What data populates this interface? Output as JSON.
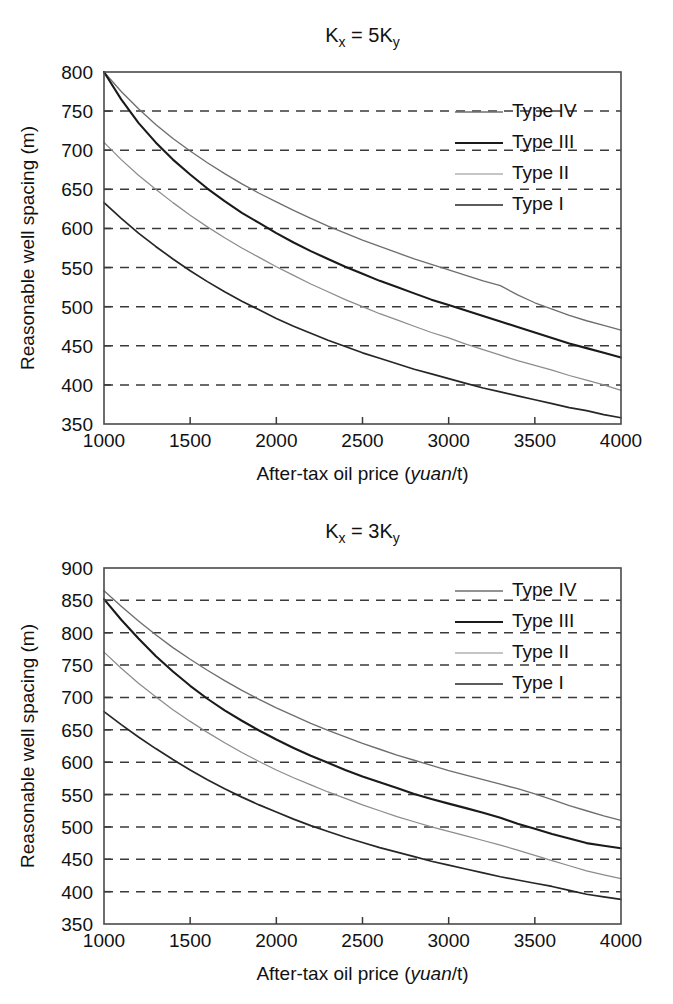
{
  "figure": {
    "background": "#ffffff",
    "series_colors": {
      "Type I": "#262626",
      "Type II": "#8c8c8c",
      "Type III": "#1a1a1a",
      "Type IV": "#6e6e6e"
    }
  },
  "panels": [
    {
      "id": "top",
      "title_main": "K",
      "title_sub1": "x",
      "title_eq": " = 5K",
      "title_sub2": "y",
      "title_plain": "Kx = 5Ky"
    },
    {
      "id": "bottom",
      "title_main": "K",
      "title_sub1": "x",
      "title_eq": " = 3K",
      "title_sub2": "y",
      "title_plain": "Kx = 3Ky"
    }
  ],
  "axis_common": {
    "xlabel_prefix": "After-tax oil price (",
    "xlabel_italic": "yuan",
    "xlabel_suffix": "/t)",
    "xlabel_plain": "After-tax oil price (yuan/t)",
    "ylabel": "Reasonable well spacing (m)",
    "xticks": [
      1000,
      1500,
      2000,
      2500,
      3000,
      3500,
      4000
    ],
    "xlim": [
      1000,
      4000
    ],
    "grid": true,
    "legend_position": "top-right"
  },
  "chart_data": [
    {
      "type": "line",
      "title": "Kx = 5Ky",
      "xlabel": "After-tax oil price (yuan/t)",
      "ylabel": "Reasonable well spacing (m)",
      "xlim": [
        1000,
        4000
      ],
      "ylim": [
        350,
        800
      ],
      "xticks": [
        1000,
        1500,
        2000,
        2500,
        3000,
        3500,
        4000
      ],
      "yticks": [
        350,
        400,
        450,
        500,
        550,
        600,
        650,
        700,
        750,
        800
      ],
      "grid": true,
      "legend": [
        "Type IV",
        "Type III",
        "Type II",
        "Type I"
      ],
      "legend_position": "top-right",
      "x": [
        1000,
        1100,
        1200,
        1300,
        1400,
        1500,
        1600,
        1700,
        1800,
        1900,
        2000,
        2100,
        2200,
        2300,
        2400,
        2500,
        2600,
        2700,
        2800,
        2900,
        3000,
        3100,
        3200,
        3300,
        3400,
        3500,
        3600,
        3700,
        3800,
        3900,
        4000
      ],
      "series": [
        {
          "name": "Type IV",
          "values": [
            800,
            775,
            753,
            733,
            715,
            699,
            684,
            670,
            657,
            645,
            634,
            623,
            613,
            603,
            594,
            585,
            577,
            569,
            561,
            554,
            547,
            540,
            533,
            527,
            515,
            505,
            497,
            489,
            482,
            476,
            470
          ]
        },
        {
          "name": "Type III",
          "values": [
            800,
            765,
            735,
            710,
            688,
            669,
            651,
            635,
            620,
            607,
            594,
            582,
            571,
            561,
            551,
            542,
            533,
            525,
            517,
            509,
            502,
            495,
            488,
            481,
            474,
            467,
            460,
            453,
            447,
            441,
            435
          ]
        },
        {
          "name": "Type II",
          "values": [
            710,
            688,
            668,
            650,
            633,
            617,
            602,
            588,
            575,
            563,
            551,
            540,
            529,
            519,
            509,
            500,
            491,
            483,
            475,
            467,
            460,
            452,
            445,
            438,
            431,
            425,
            419,
            412,
            406,
            400,
            393
          ]
        },
        {
          "name": "Type I",
          "values": [
            633,
            613,
            594,
            577,
            561,
            546,
            532,
            519,
            507,
            496,
            485,
            475,
            466,
            457,
            449,
            441,
            434,
            427,
            420,
            414,
            408,
            402,
            396,
            391,
            386,
            381,
            376,
            371,
            367,
            362,
            358
          ]
        }
      ]
    },
    {
      "type": "line",
      "title": "Kx = 3Ky",
      "xlabel": "After-tax oil price (yuan/t)",
      "ylabel": "Reasonable well spacing (m)",
      "xlim": [
        1000,
        4000
      ],
      "ylim": [
        350,
        900
      ],
      "xticks": [
        1000,
        1500,
        2000,
        2500,
        3000,
        3500,
        4000
      ],
      "yticks": [
        350,
        400,
        450,
        500,
        550,
        600,
        650,
        700,
        750,
        800,
        850,
        900
      ],
      "grid": true,
      "legend": [
        "Type IV",
        "Type III",
        "Type II",
        "Type I"
      ],
      "legend_position": "top-right",
      "x": [
        1000,
        1100,
        1200,
        1300,
        1400,
        1500,
        1600,
        1700,
        1800,
        1900,
        2000,
        2100,
        2200,
        2300,
        2400,
        2500,
        2600,
        2700,
        2800,
        2900,
        3000,
        3100,
        3200,
        3300,
        3400,
        3500,
        3600,
        3700,
        3800,
        3900,
        4000
      ],
      "series": [
        {
          "name": "Type IV",
          "values": [
            865,
            841,
            818,
            797,
            777,
            759,
            742,
            726,
            711,
            697,
            684,
            672,
            660,
            649,
            639,
            629,
            620,
            611,
            603,
            595,
            587,
            580,
            573,
            566,
            559,
            551,
            542,
            533,
            525,
            517,
            510
          ]
        },
        {
          "name": "Type III",
          "values": [
            852,
            820,
            791,
            764,
            740,
            718,
            698,
            680,
            664,
            649,
            635,
            622,
            610,
            599,
            588,
            578,
            569,
            560,
            551,
            543,
            536,
            529,
            522,
            514,
            505,
            497,
            489,
            482,
            475,
            471,
            467
          ]
        },
        {
          "name": "Type II",
          "values": [
            770,
            745,
            722,
            701,
            681,
            663,
            646,
            630,
            615,
            601,
            588,
            576,
            565,
            554,
            544,
            534,
            525,
            516,
            508,
            500,
            493,
            486,
            479,
            472,
            464,
            456,
            448,
            440,
            432,
            426,
            420
          ]
        },
        {
          "name": "Type I",
          "values": [
            678,
            658,
            639,
            621,
            604,
            588,
            573,
            559,
            546,
            534,
            523,
            512,
            502,
            493,
            484,
            476,
            468,
            461,
            454,
            447,
            441,
            435,
            429,
            423,
            418,
            413,
            408,
            402,
            396,
            392,
            388
          ]
        }
      ]
    }
  ]
}
